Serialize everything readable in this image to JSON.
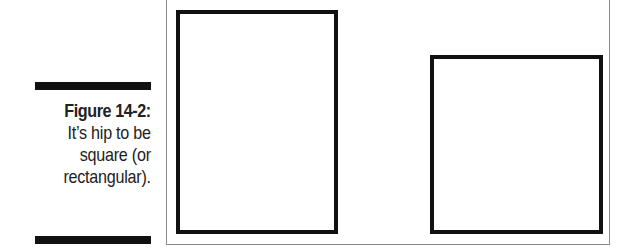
{
  "figure": {
    "label": "Figure 14-2:",
    "caption_lines": [
      "It’s hip to be",
      "square (or",
      "rectangular)."
    ]
  },
  "shapes": [
    {
      "name": "rectangle",
      "left": 176,
      "top": 10,
      "width": 162,
      "height": 224
    },
    {
      "name": "square",
      "left": 430,
      "top": 55,
      "width": 173,
      "height": 179
    }
  ],
  "colors": {
    "stroke": "#111111",
    "frame": "#888888",
    "background": "#ffffff"
  }
}
